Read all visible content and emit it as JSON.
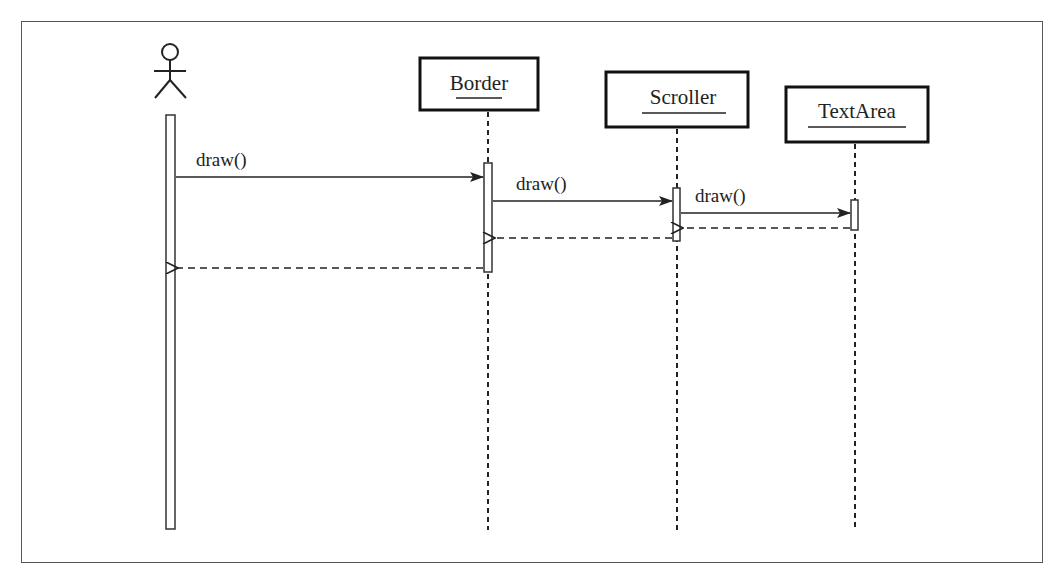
{
  "diagram": {
    "type": "UML sequence diagram",
    "actor": {
      "name": "actor",
      "label": ""
    },
    "objects": [
      {
        "id": "border",
        "label": "Border"
      },
      {
        "id": "scroller",
        "label": "Scroller"
      },
      {
        "id": "textarea",
        "label": "TextArea"
      }
    ],
    "messages": [
      {
        "from": "actor",
        "to": "border",
        "label": "draw()",
        "kind": "call"
      },
      {
        "from": "border",
        "to": "scroller",
        "label": "draw()",
        "kind": "call"
      },
      {
        "from": "scroller",
        "to": "textarea",
        "label": "draw()",
        "kind": "call"
      },
      {
        "from": "textarea",
        "to": "scroller",
        "label": "",
        "kind": "return"
      },
      {
        "from": "scroller",
        "to": "border",
        "label": "",
        "kind": "return"
      },
      {
        "from": "border",
        "to": "actor",
        "label": "",
        "kind": "return"
      }
    ]
  }
}
